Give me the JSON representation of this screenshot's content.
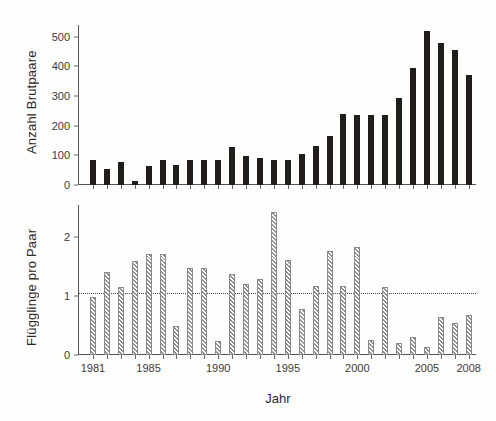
{
  "figure": {
    "xlabel": "Jahr",
    "xticks": [
      {
        "year": 1981,
        "label": "1981"
      },
      {
        "year": 1985,
        "label": "1985"
      },
      {
        "year": 1990,
        "label": "1990"
      },
      {
        "year": 1995,
        "label": "1995"
      },
      {
        "year": 2000,
        "label": "2000"
      },
      {
        "year": 2005,
        "label": "2005"
      },
      {
        "year": 2008,
        "label": "2008"
      }
    ]
  },
  "chart_data": [
    {
      "type": "bar",
      "panel": "top",
      "title": "",
      "xlabel": "",
      "ylabel": "Anzahl Brutpaare",
      "ylim": [
        0,
        540
      ],
      "yticks": [
        0,
        100,
        200,
        300,
        400,
        500
      ],
      "ytick_labels": [
        "0",
        "100",
        "200",
        "300",
        "400",
        "500"
      ],
      "grid": false,
      "legend": "none",
      "bar_style": "solid-black",
      "categories": [
        1981,
        1982,
        1983,
        1984,
        1985,
        1986,
        1987,
        1988,
        1989,
        1990,
        1991,
        1992,
        1993,
        1994,
        1995,
        1996,
        1997,
        1998,
        1999,
        2000,
        2001,
        2002,
        2003,
        2004,
        2005,
        2006,
        2007,
        2008
      ],
      "values": [
        85,
        55,
        78,
        14,
        65,
        85,
        67,
        83,
        83,
        83,
        128,
        98,
        92,
        84,
        86,
        105,
        130,
        165,
        240,
        237,
        235,
        237,
        292,
        395,
        520,
        478,
        455,
        370
      ]
    },
    {
      "type": "bar",
      "panel": "bottom",
      "title": "",
      "xlabel": "Jahr",
      "ylabel": "Flügglinge pro Paar",
      "ylim": [
        0,
        2.55
      ],
      "yticks": [
        0,
        1,
        2
      ],
      "ytick_labels": [
        "0",
        "1",
        "2"
      ],
      "grid": false,
      "legend": "none",
      "bar_style": "hatched-diagonal",
      "reference_line": {
        "value": 1.05,
        "style": "dotted",
        "label": ""
      },
      "categories": [
        1981,
        1982,
        1983,
        1984,
        1985,
        1986,
        1987,
        1988,
        1989,
        1990,
        1991,
        1992,
        1993,
        1994,
        1995,
        1996,
        1997,
        1998,
        1999,
        2000,
        2001,
        2002,
        2003,
        2004,
        2005,
        2006,
        2007,
        2008
      ],
      "values": [
        0.99,
        1.41,
        1.16,
        1.59,
        1.72,
        1.72,
        0.49,
        1.48,
        1.48,
        0.24,
        1.37,
        1.21,
        1.29,
        2.43,
        1.61,
        0.79,
        1.17,
        1.77,
        1.18,
        1.84,
        0.25,
        1.15,
        0.21,
        0.3,
        0.13,
        0.65,
        0.54,
        0.68
      ]
    }
  ]
}
